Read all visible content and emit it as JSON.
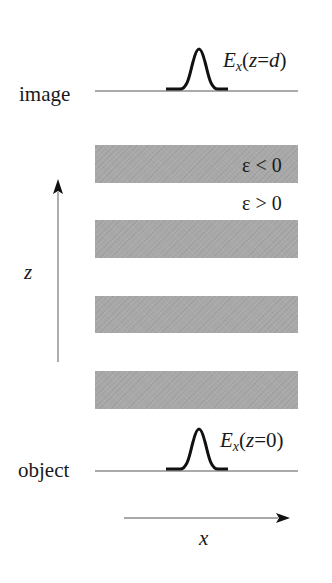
{
  "diagram": {
    "planes": {
      "image": {
        "label": "image",
        "field": {
          "symbol": "E",
          "subscript": "x",
          "argument_pre": "(",
          "argument_var": "z",
          "argument_eq": "=",
          "argument_val": "d",
          "argument_post": ")"
        }
      },
      "object": {
        "label": "object",
        "field": {
          "symbol": "E",
          "subscript": "x",
          "argument_pre": "(",
          "argument_var": "z",
          "argument_eq": "=",
          "argument_val": "0",
          "argument_post": ")"
        }
      }
    },
    "layers": {
      "negative_label": "ε < 0",
      "positive_label": "ε > 0",
      "count": 4,
      "color": "#a8a8a8"
    },
    "axes": {
      "z_label": "z",
      "x_label": "x"
    },
    "colors": {
      "line": "#555555",
      "pulse": "#111111",
      "arrow": "#111111"
    }
  }
}
